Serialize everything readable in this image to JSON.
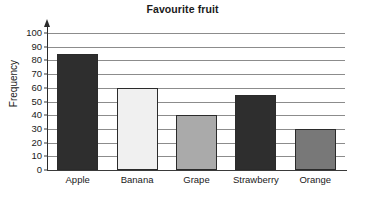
{
  "chart_data": {
    "type": "bar",
    "title": "Favourite fruit",
    "xlabel": "",
    "ylabel": "Frequency",
    "categories": [
      "Apple",
      "Banana",
      "Grape",
      "Strawberry",
      "Orange"
    ],
    "values": [
      85,
      60,
      40,
      55,
      30
    ],
    "bar_colors": [
      "#2e2e2e",
      "#f0f0f0",
      "#aaaaaa",
      "#2e2e2e",
      "#787878"
    ],
    "bar_outline_color": "#2b2b2b",
    "ylim": [
      0,
      100
    ],
    "ytick_step": 10,
    "yticks": [
      0,
      10,
      20,
      30,
      40,
      50,
      60,
      70,
      80,
      90,
      100
    ],
    "ytick_labels": [
      "0",
      "10",
      "20",
      "30",
      "40",
      "50",
      "60",
      "70",
      "80",
      "90",
      "100"
    ],
    "grid": true,
    "grid_orientation": "horizontal",
    "grid_color": "#8c8c8c",
    "legend": false,
    "background_color": "#ffffff",
    "text_color": "#1a1a1a"
  }
}
